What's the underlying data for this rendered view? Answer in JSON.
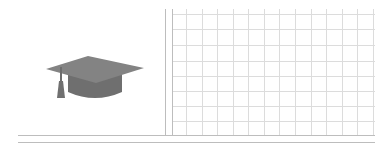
{
  "illustration": {
    "subject": "graduation-cap",
    "cap_color": "#7a7a7a",
    "cap_top_color": "#858585",
    "cap_band_color": "#6f6f6f",
    "tassel_color": "#707070"
  },
  "grid": {
    "line_color": "#dcdcdc",
    "frame_color": "#bdbdbd",
    "vertical_lines_x": [
      186,
      202,
      217,
      233,
      248,
      264,
      279,
      295,
      311,
      326,
      342,
      357,
      373
    ],
    "horizontal_lines_y": [
      14,
      29,
      45,
      61,
      76,
      91,
      106,
      121
    ],
    "margin_vertical_x": [
      165,
      172
    ],
    "margin_horizontal_y": [
      135,
      142
    ],
    "grid_left": 172,
    "grid_right": 375,
    "grid_top": 9,
    "grid_bottom": 135,
    "rule_left": 18,
    "rule_right": 375
  }
}
